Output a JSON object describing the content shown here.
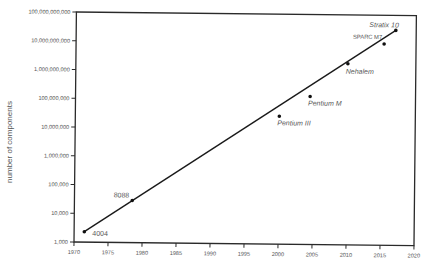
{
  "chart_data": {
    "type": "scatter",
    "title": "",
    "xlabel": "",
    "ylabel": "number of components",
    "xscale": "linear",
    "yscale": "log",
    "xlim": [
      1970,
      2020
    ],
    "ylim": [
      1000,
      100000000000
    ],
    "grid": false,
    "legend": null,
    "x_ticks": [
      1970,
      1975,
      1980,
      1985,
      1990,
      1995,
      2000,
      2005,
      2010,
      2015,
      2020
    ],
    "x_tick_labels": [
      "1970",
      "1975",
      "1980",
      "1985",
      "1990",
      "1995",
      "2000",
      "2005",
      "2010",
      "2015",
      "2020"
    ],
    "y_ticks": [
      1000,
      10000,
      100000,
      1000000,
      10000000,
      100000000,
      1000000000,
      10000000000,
      100000000000
    ],
    "y_tick_labels": [
      "1,000",
      "10,000",
      "100,000",
      "1,000,000",
      "10,000,000",
      "100,000,000",
      "1,000,000,000",
      "10,000,000,000",
      "100,000,000,000"
    ],
    "points": [
      {
        "label": "4004",
        "x": 1971.5,
        "y": 2300,
        "style": "normal",
        "on_trend": true
      },
      {
        "label": "8088",
        "x": 1978.5,
        "y": 29000,
        "style": "normal",
        "on_trend": true
      },
      {
        "label": "Pentium III",
        "x": 2000,
        "y": 28000000,
        "style": "italic",
        "on_trend": false
      },
      {
        "label": "Pentium M",
        "x": 2004.5,
        "y": 140000000,
        "style": "italic",
        "on_trend": false
      },
      {
        "label": "Nehalem",
        "x": 2010,
        "y": 2000000000,
        "style": "italic",
        "on_trend": true
      },
      {
        "label": "SPARC M7",
        "x": 2015.3,
        "y": 10000000000,
        "style": "normal",
        "on_trend": false
      },
      {
        "label": "Stratix 10",
        "x": 2017,
        "y": 30000000000,
        "style": "italic",
        "on_trend": true
      }
    ],
    "trend_line": {
      "from": {
        "x": 1971.5,
        "y": 2300
      },
      "to": {
        "x": 2017,
        "y": 30000000000
      }
    }
  }
}
